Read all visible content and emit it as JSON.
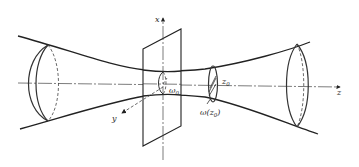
{
  "figure": {
    "labels": {
      "x_axis": "x",
      "y_axis": "y",
      "z_axis": "z",
      "waist": "ω",
      "waist_sub": "0",
      "position": "z",
      "position_sub": "0",
      "radius_at_z": "ω(z",
      "radius_at_z_sub": "0",
      "radius_at_z_close": ")"
    },
    "colors": {
      "line": "#222222",
      "background": "#ffffff"
    }
  }
}
